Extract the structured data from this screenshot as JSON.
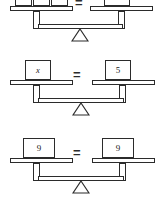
{
  "page": {
    "background_color": "#ffffff",
    "line_color": "#2b2b2b",
    "text_color": "#1a1a1a"
  },
  "balances": [
    {
      "id": "balance-top",
      "note": "top balance is cropped at the top edge of the image",
      "left": {
        "boxes": [
          {
            "label": "x",
            "italic": true
          },
          {
            "label": "+",
            "italic": false
          },
          {
            "label": "4",
            "italic": false
          }
        ]
      },
      "operator": "=",
      "right": {
        "boxes": [
          {
            "label": "9",
            "italic": false
          }
        ]
      }
    },
    {
      "id": "balance-middle",
      "left": {
        "boxes": [
          {
            "label": "x",
            "italic": true
          }
        ]
      },
      "operator": "=",
      "right": {
        "boxes": [
          {
            "label": "5",
            "italic": false
          }
        ]
      }
    },
    {
      "id": "balance-bottom",
      "left": {
        "boxes": [
          {
            "label": "9",
            "italic": false
          }
        ]
      },
      "operator": "=",
      "right": {
        "boxes": [
          {
            "label": "9",
            "italic": false
          }
        ]
      }
    }
  ]
}
